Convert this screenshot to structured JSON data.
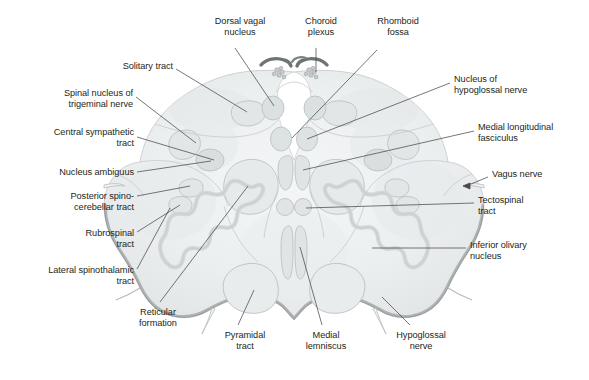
{
  "figure": {
    "type": "anatomical-cross-section",
    "colors": {
      "tissue_fill": "#eef0f1",
      "tissue_fill_deep": "#e4e7e8",
      "tissue_edge": "#c9cdce",
      "shadow_rim": "#a9acad",
      "nucleus_outline": "#b9bfc0",
      "nucleus_fill": "#e2e6e7",
      "olive_band": "#d8dcdd",
      "choroid_plexus": "#6e7475",
      "leader_line": "#4a4a4a",
      "label_text": "#231f20",
      "background": "#ffffff"
    }
  },
  "labels": [
    {
      "id": "dorsal-vagal-nucleus",
      "text": "Dorsal vagal\nnucleus",
      "align": "c",
      "x": 192,
      "y": 16,
      "w": 96
    },
    {
      "id": "choroid-plexus",
      "text": "Choroid\nplexus",
      "align": "c",
      "x": 287,
      "y": 16,
      "w": 68
    },
    {
      "id": "rhomboid-fossa",
      "text": "Rhomboid\nfossa",
      "align": "c",
      "x": 361,
      "y": 16,
      "w": 74
    },
    {
      "id": "solitary-tract",
      "text": "Solitary tract",
      "align": "r",
      "x": 51,
      "y": 61,
      "w": 122
    },
    {
      "id": "spinal-nucleus-of-trigeminal-nerve",
      "text": "Spinal nucleus of\ntrigeminal nerve",
      "align": "r",
      "x": 23,
      "y": 88,
      "w": 110
    },
    {
      "id": "nucleus-of-hypoglossal-nerve",
      "text": "Nucleus of\nhypoglossal nerve",
      "align": "l",
      "x": 454,
      "y": 74,
      "w": 126
    },
    {
      "id": "central-sympathetic-tract",
      "text": "Central sympathetic\ntract",
      "align": "r",
      "x": 14,
      "y": 127,
      "w": 120
    },
    {
      "id": "medial-longitudinal-fasciculus",
      "text": "Medial longitudinal\nfasciculus",
      "align": "l",
      "x": 478,
      "y": 122,
      "w": 112
    },
    {
      "id": "nucleus-ambiguus",
      "text": "Nucleus ambiguus",
      "align": "r",
      "x": 23,
      "y": 167,
      "w": 111
    },
    {
      "id": "vagus-nerve",
      "text": "Vagus nerve",
      "align": "l",
      "x": 492,
      "y": 169,
      "w": 90
    },
    {
      "id": "posterior-spinocerebellar-tract",
      "text": "Posterior spino-\ncerebellar tract",
      "align": "r",
      "x": 28,
      "y": 191,
      "w": 106
    },
    {
      "id": "tectospinal-tract",
      "text": "Tectospinal\ntract",
      "align": "l",
      "x": 478,
      "y": 195,
      "w": 90
    },
    {
      "id": "rubrospinal-tract",
      "text": "Rubrospinal\ntract",
      "align": "r",
      "x": 44,
      "y": 228,
      "w": 90
    },
    {
      "id": "lateral-spinothalamic-tract",
      "text": "Lateral spinothalamic\ntract",
      "align": "r",
      "x": 14,
      "y": 265,
      "w": 120
    },
    {
      "id": "inferior-olivary-nucleus",
      "text": "Inferior olivary\nnucleus",
      "align": "l",
      "x": 470,
      "y": 240,
      "w": 110
    },
    {
      "id": "reticular-formation",
      "text": "Reticular\nformation",
      "align": "c",
      "x": 122,
      "y": 307,
      "w": 72
    },
    {
      "id": "pyramidal-tract",
      "text": "Pyramidal\ntract",
      "align": "c",
      "x": 209,
      "y": 330,
      "w": 72
    },
    {
      "id": "medial-lemniscus",
      "text": "Medial\nlemniscus",
      "align": "c",
      "x": 290,
      "y": 330,
      "w": 72
    },
    {
      "id": "hypoglossal-nerve",
      "text": "Hypoglossal\nnerve",
      "align": "c",
      "x": 378,
      "y": 330,
      "w": 86
    }
  ],
  "structures": [
    {
      "id": "fourth-ventricle",
      "name": "fourth ventricle / rhomboid fossa"
    },
    {
      "id": "choroid-plexus-tufts",
      "name": "choroid plexus tufts"
    },
    {
      "id": "solitary-tract-nucleus",
      "name": "solitary tract nucleus"
    },
    {
      "id": "dorsal-vagal-nucleus",
      "name": "dorsal vagal nucleus"
    },
    {
      "id": "hypoglossal-nucleus",
      "name": "nucleus of hypoglossal nerve"
    },
    {
      "id": "mlf",
      "name": "medial longitudinal fasciculus"
    },
    {
      "id": "tectospinal-tract",
      "name": "tectospinal tract"
    },
    {
      "id": "spinal-trigeminal-nucleus",
      "name": "spinal nucleus of trigeminal nerve"
    },
    {
      "id": "nucleus-ambiguus",
      "name": "nucleus ambiguus"
    },
    {
      "id": "inferior-olivary-nucleus",
      "name": "inferior olivary nucleus"
    },
    {
      "id": "pyramidal-tract",
      "name": "pyramidal tract"
    },
    {
      "id": "medial-lemniscus",
      "name": "medial lemniscus"
    },
    {
      "id": "vagus-nerve-rootlet",
      "name": "vagus nerve rootlet"
    },
    {
      "id": "hypoglossal-nerve-rootlet",
      "name": "hypoglossal nerve rootlet"
    }
  ]
}
